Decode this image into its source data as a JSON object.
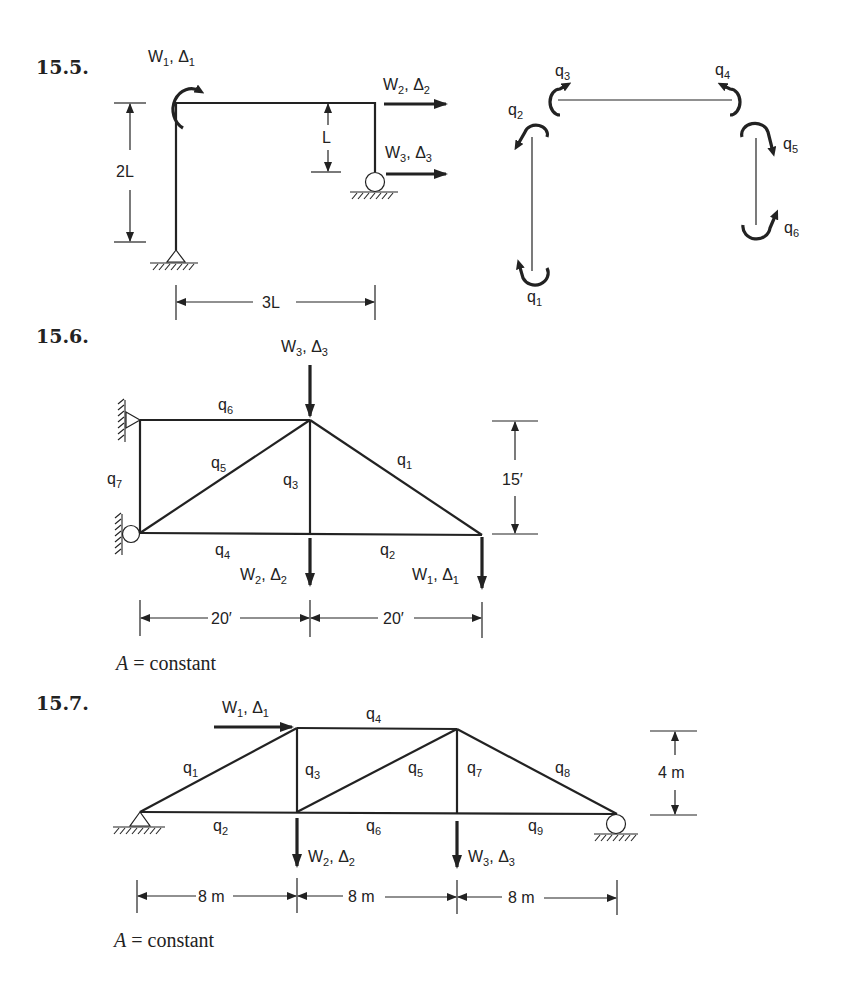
{
  "problems": [
    {
      "number": "15.5.",
      "loads": [
        {
          "W": "W",
          "W_sub": "1",
          "D": "Δ",
          "D_sub": "1",
          "type": "moment"
        },
        {
          "W": "W",
          "W_sub": "2",
          "D": "Δ",
          "D_sub": "2",
          "type": "horizontal"
        },
        {
          "W": "W",
          "W_sub": "3",
          "D": "Δ",
          "D_sub": "3",
          "type": "horizontal"
        }
      ],
      "dimensions": {
        "height": "2L",
        "offset": "L",
        "span": "3L"
      },
      "member_forces": [
        {
          "q": "q",
          "sub": "1"
        },
        {
          "q": "q",
          "sub": "2"
        },
        {
          "q": "q",
          "sub": "3"
        },
        {
          "q": "q",
          "sub": "4"
        },
        {
          "q": "q",
          "sub": "5"
        },
        {
          "q": "q",
          "sub": "6"
        }
      ]
    },
    {
      "number": "15.6.",
      "loads": [
        {
          "W": "W",
          "W_sub": "1",
          "D": "Δ",
          "D_sub": "1"
        },
        {
          "W": "W",
          "W_sub": "2",
          "D": "Δ",
          "D_sub": "2"
        },
        {
          "W": "W",
          "W_sub": "3",
          "D": "Δ",
          "D_sub": "3"
        }
      ],
      "members": [
        {
          "q": "q",
          "sub": "1"
        },
        {
          "q": "q",
          "sub": "2"
        },
        {
          "q": "q",
          "sub": "3"
        },
        {
          "q": "q",
          "sub": "4"
        },
        {
          "q": "q",
          "sub": "5"
        },
        {
          "q": "q",
          "sub": "6"
        },
        {
          "q": "q",
          "sub": "7"
        }
      ],
      "dimensions": {
        "height": "15′",
        "spans": [
          "20′",
          "20′"
        ]
      },
      "note": {
        "var": "A",
        "text": " = constant"
      }
    },
    {
      "number": "15.7.",
      "loads": [
        {
          "W": "W",
          "W_sub": "1",
          "D": "Δ",
          "D_sub": "1"
        },
        {
          "W": "W",
          "W_sub": "2",
          "D": "Δ",
          "D_sub": "2"
        },
        {
          "W": "W",
          "W_sub": "3",
          "D": "Δ",
          "D_sub": "3"
        }
      ],
      "members": [
        {
          "q": "q",
          "sub": "1"
        },
        {
          "q": "q",
          "sub": "2"
        },
        {
          "q": "q",
          "sub": "3"
        },
        {
          "q": "q",
          "sub": "4"
        },
        {
          "q": "q",
          "sub": "5"
        },
        {
          "q": "q",
          "sub": "6"
        },
        {
          "q": "q",
          "sub": "7"
        },
        {
          "q": "q",
          "sub": "8"
        },
        {
          "q": "q",
          "sub": "9"
        }
      ],
      "dimensions": {
        "height": "4 m",
        "spans": [
          "8 m",
          "8 m",
          "8 m"
        ]
      },
      "note": {
        "var": "A",
        "text": " = constant"
      }
    }
  ]
}
